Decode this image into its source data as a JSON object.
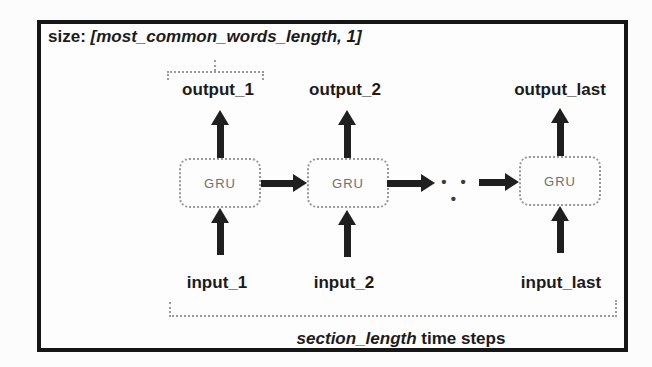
{
  "diagram": {
    "size_label": {
      "prefix": "size: ",
      "value": "[most_common_words_length, 1]"
    },
    "outputs": [
      "output_1",
      "output_2",
      "output_last"
    ],
    "inputs": [
      "input_1",
      "input_2",
      "input_last"
    ],
    "gru_label": "GRU",
    "ellipsis": "• • •",
    "caption": {
      "italic": "section_length",
      "rest": " time steps"
    },
    "colors": {
      "frame_border": "#161616",
      "arrow": "#1f1f1f",
      "box_border": "#989898",
      "gru_text": "#6f6f6f",
      "bracket": "#9a9a9a",
      "label_text": "#1b1b1b",
      "background": "#fdfdfd"
    }
  }
}
